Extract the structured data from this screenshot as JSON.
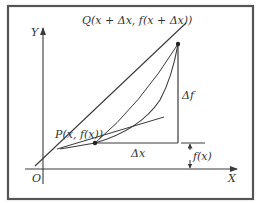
{
  "diagram": {
    "axes": {
      "y_label": "Y",
      "x_label": "X",
      "origin_label": "O"
    },
    "points": {
      "P": {
        "label": "P(x, f(x))"
      },
      "Q": {
        "label": "Q(x + Δx, f(x + Δx))"
      }
    },
    "annotations": {
      "delta_x": "Δx",
      "delta_f": "Δf",
      "f_x": "f(x)"
    },
    "elements": [
      "curve y=f(x)",
      "secant line through P and Q",
      "tangent line at P",
      "horizontal segment Δx",
      "vertical segment Δf",
      "height marker f(x)"
    ],
    "colors": {
      "frame": "#555555",
      "line": "#3a3a3a",
      "text": "#333333",
      "background": "#ffffff"
    }
  }
}
